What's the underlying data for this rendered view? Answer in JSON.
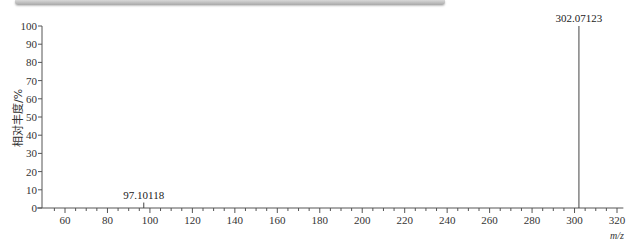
{
  "header": {
    "text": ""
  },
  "chart_data": {
    "type": "bar",
    "title": "",
    "xlabel": "m/z",
    "ylabel": "相对丰度/%",
    "xlim": [
      50,
      323
    ],
    "ylim": [
      0,
      100
    ],
    "x_ticks": [
      60,
      80,
      100,
      120,
      140,
      160,
      180,
      200,
      220,
      240,
      260,
      280,
      300,
      320
    ],
    "y_ticks": [
      0,
      10,
      20,
      30,
      40,
      50,
      60,
      70,
      80,
      90,
      100
    ],
    "grid": false,
    "legend": null,
    "peaks": [
      {
        "mz": 97.10118,
        "abundance": 3,
        "label": "97.10118"
      },
      {
        "mz": 302.07123,
        "abundance": 100,
        "label": "302.07123"
      }
    ]
  }
}
